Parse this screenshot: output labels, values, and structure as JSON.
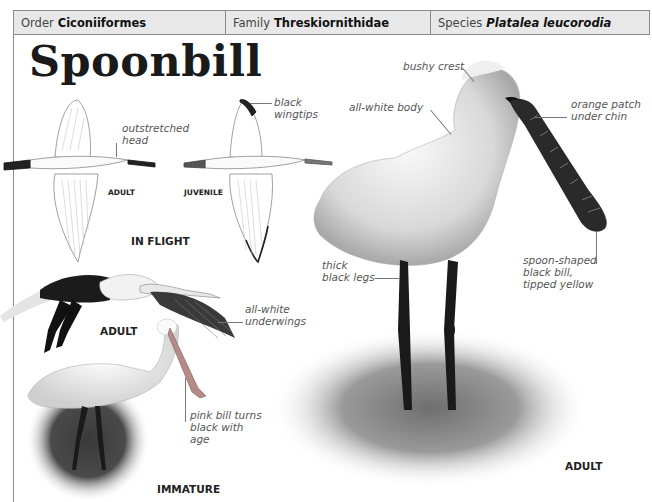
{
  "header": {
    "order_label": "Order",
    "order_value": "Ciconiiformes",
    "family_label": "Family",
    "family_value": "Threskiornithidae",
    "species_label": "Species",
    "species_value": "Platalea leucorodia"
  },
  "title": "Spoonbill",
  "in_flight": {
    "section_caption": "IN FLIGHT",
    "adult_caption": "ADULT",
    "juvenile_caption": "JUVENILE",
    "annotations": {
      "outstretched_head": [
        "outstretched",
        "head"
      ],
      "black_wingtips": [
        "black",
        "wingtips"
      ]
    }
  },
  "adult_flying": {
    "caption": "ADULT",
    "annotation": [
      "all-white",
      "underwings"
    ]
  },
  "immature": {
    "caption": "IMMATURE",
    "annotation": [
      "pink bill turns",
      "black with",
      "age"
    ]
  },
  "adult_standing": {
    "caption": "ADULT",
    "annotations": {
      "bushy_crest": "bushy crest",
      "all_white_body": "all-white body",
      "orange_patch": [
        "orange patch",
        "under chin"
      ],
      "thick_legs": [
        "thick",
        "black legs"
      ],
      "spoon_bill": [
        "spoon-shaped",
        "black bill,",
        "tipped yellow"
      ]
    }
  },
  "colors": {
    "header_bg": "#e8e8e8",
    "border": "#8a8a8a",
    "annotation_text": "#555555",
    "caption_text": "#222222"
  }
}
